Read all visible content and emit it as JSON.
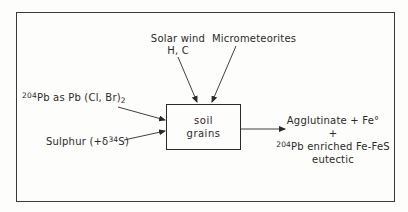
{
  "diagram": {
    "central_node": {
      "line1": "soil",
      "line2": "grains"
    },
    "inputs": {
      "solar_wind": {
        "line1": "Solar wind",
        "line2": "H, C"
      },
      "micrometeorites": {
        "label": "Micrometeorites"
      },
      "lead": {
        "isotope_mass": "204",
        "text": "Pb as Pb (Cl, Br)",
        "subscript": "2"
      },
      "sulphur": {
        "prefix": "Sulphur (+δ",
        "isotope_mass": "34",
        "suffix": "S)"
      }
    },
    "output": {
      "line1": "Agglutinate + Fe°",
      "line2": "+",
      "line3_isotope": "204",
      "line3_text": "Pb enriched Fe-FeS",
      "line4": "eutectic"
    },
    "colors": {
      "line": "#2a2a2a",
      "background": "#fdfdfb"
    }
  }
}
